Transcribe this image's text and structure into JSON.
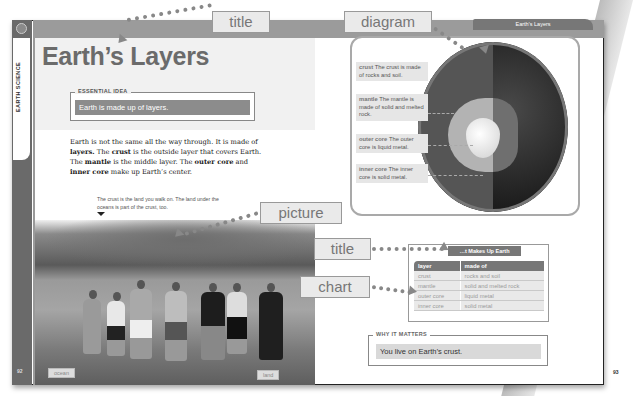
{
  "left_page": {
    "spine_label": "EARTH SCIENCE",
    "page_number": "92",
    "title": "Earth’s Layers",
    "essential_idea": {
      "label": "ESSENTIAL IDEA",
      "text": "Earth is made up of layers."
    },
    "body_text_html": "Earth is not the same all the way through. It is made of <b>layers.</b> The <b>crust</b> is the outside layer that covers Earth. The <b>mantle</b> is the middle layer. The <b>outer core</b> and <b>inner core</b> make up Earth’s center.",
    "photo_caption": "The crust is the land you walk on. The land under the oceans is part of the crust, too.",
    "photo_tags": {
      "ocean": "ocean",
      "land": "land"
    }
  },
  "right_page": {
    "running_head": "Earth’s Layers",
    "page_number": "93",
    "diagram_callouts": [
      {
        "term": "crust",
        "text": "The crust is made of rocks and soil."
      },
      {
        "term": "mantle",
        "text": "The mantle is made of solid and melted rock."
      },
      {
        "term": "outer core",
        "text": "The outer core is liquid metal."
      },
      {
        "term": "inner core",
        "text": "The inner core is solid metal."
      }
    ],
    "table": {
      "title": "What Makes Up Earth",
      "title_visible": "…t Makes Up Earth",
      "headers": [
        "layer",
        "made of"
      ],
      "rows": [
        [
          "crust",
          "rocks and soil"
        ],
        [
          "mantle",
          "solid and melted rock"
        ],
        [
          "outer core",
          "liquid metal"
        ],
        [
          "inner core",
          "solid metal"
        ]
      ]
    },
    "why_it_matters": {
      "label": "WHY IT MATTERS",
      "text": "You live on Earth’s crust."
    }
  },
  "annotations": {
    "title_top": "title",
    "diagram": "diagram",
    "picture": "picture",
    "title_table": "title",
    "chart": "chart"
  }
}
